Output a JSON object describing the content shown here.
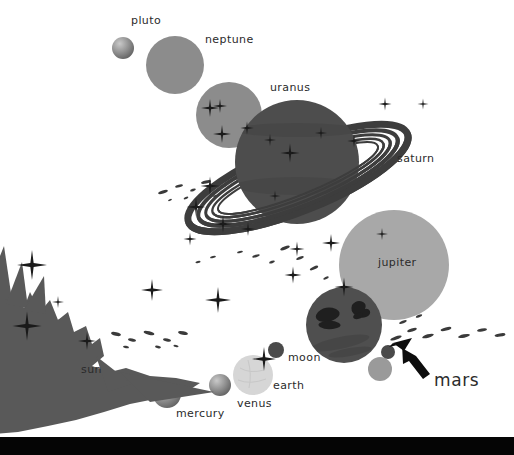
{
  "canvas": {
    "width": 514,
    "height": 455,
    "background": "#ffffff",
    "description": "Stylized solar system poster illustration, grayscale, planets labelled in lowercase, black band across the bottom edge"
  },
  "palette": {
    "background": "#ffffff",
    "ink": "#2b2b2b",
    "bottom_bar": "#050505",
    "planet_dark": "#4d4d4d",
    "planet_mid": "#8c8c8c",
    "planet_light": "#b3b3b3",
    "planet_pale": "#d4d4d4",
    "sun_body": "#595959",
    "mars_body": "#4f4f4f",
    "ring": "#3d3d3d",
    "star": "#1a1a1a",
    "debris": "#3a3a3a",
    "arrow": "#0d0d0d"
  },
  "labels": [
    {
      "id": "pluto",
      "text": "pluto",
      "x": 131,
      "y": 21,
      "size": "small"
    },
    {
      "id": "neptune",
      "text": "neptune",
      "x": 205,
      "y": 40,
      "size": "small"
    },
    {
      "id": "uranus",
      "text": "uranus",
      "x": 270,
      "y": 88,
      "size": "small"
    },
    {
      "id": "saturn",
      "text": "saturn",
      "x": 397,
      "y": 159,
      "size": "small"
    },
    {
      "id": "jupiter",
      "text": "jupiter",
      "x": 378,
      "y": 263,
      "size": "small"
    },
    {
      "id": "moon",
      "text": "moon",
      "x": 288,
      "y": 358,
      "size": "small"
    },
    {
      "id": "earth",
      "text": "earth",
      "x": 273,
      "y": 386,
      "size": "small"
    },
    {
      "id": "venus",
      "text": "venus",
      "x": 237,
      "y": 404,
      "size": "small"
    },
    {
      "id": "mercury",
      "text": "mercury",
      "x": 176,
      "y": 414,
      "size": "small"
    },
    {
      "id": "sun",
      "text": "sun",
      "x": 81,
      "y": 370,
      "size": "small"
    },
    {
      "id": "mars",
      "text": "mars",
      "x": 434,
      "y": 381,
      "size": "big"
    }
  ],
  "bodies": [
    {
      "id": "pluto",
      "name": "pluto",
      "cx": 123,
      "cy": 48,
      "r": 11,
      "fill": "#8f8f8f",
      "shaded": true
    },
    {
      "id": "neptune",
      "name": "neptune",
      "cx": 175,
      "cy": 65,
      "r": 29,
      "fill": "#8c8c8c",
      "shaded": false
    },
    {
      "id": "uranus",
      "name": "uranus",
      "cx": 229,
      "cy": 115,
      "r": 33,
      "fill": "#8c8c8c",
      "shaded": false
    },
    {
      "id": "saturn",
      "name": "saturn",
      "cx": 297,
      "cy": 162,
      "r": 62,
      "fill": "#4d4d4d",
      "shaded": false
    },
    {
      "id": "jupiter",
      "name": "jupiter",
      "cx": 394,
      "cy": 265,
      "r": 55,
      "fill": "#a8a8a8",
      "shaded": false
    },
    {
      "id": "mars",
      "name": "mars",
      "cx": 344,
      "cy": 325,
      "r": 38,
      "fill": "#4f4f4f",
      "shaded": false
    },
    {
      "id": "moon",
      "name": "moon",
      "cx": 276,
      "cy": 350,
      "r": 8,
      "fill": "#4a4a4a",
      "shaded": false
    },
    {
      "id": "earth",
      "name": "earth",
      "cx": 253,
      "cy": 375,
      "r": 20,
      "fill": "#d6d6d6",
      "shaded": false
    },
    {
      "id": "venus",
      "name": "venus",
      "cx": 220,
      "cy": 385,
      "r": 11,
      "fill": "#8a8a8a",
      "shaded": true
    },
    {
      "id": "mercury",
      "name": "mercury",
      "cx": 167,
      "cy": 394,
      "r": 14,
      "fill": "#8f8f8f",
      "shaded": true
    },
    {
      "id": "asteroid-a",
      "name": "asteroid",
      "cx": 380,
      "cy": 369,
      "r": 12,
      "fill": "#9a9a9a",
      "shaded": false
    },
    {
      "id": "asteroid-b",
      "name": "asteroid",
      "cx": 388,
      "cy": 352,
      "r": 7,
      "fill": "#4a4a4a",
      "shaded": false
    }
  ],
  "saturn_ring": {
    "cx": 298,
    "cy": 178,
    "rx": 118,
    "ry": 34,
    "rotation_deg": -22,
    "bands": 6,
    "color": "#3d3d3d"
  },
  "sun": {
    "id": "sun",
    "description": "spiky flame-like corona silhouette anchored at the lower-left corner",
    "color": "#595959"
  },
  "arrow": {
    "id": "mars-pointer",
    "description": "thick black arrow pointing up-left at mars",
    "tip_x": 395,
    "tip_y": 344,
    "tail_x": 432,
    "tail_y": 375,
    "color": "#0d0d0d"
  },
  "stars": [
    {
      "x": 32,
      "y": 265,
      "size": 30
    },
    {
      "x": 27,
      "y": 326,
      "size": 28
    },
    {
      "x": 87,
      "y": 341,
      "size": 17
    },
    {
      "x": 152,
      "y": 290,
      "size": 22
    },
    {
      "x": 218,
      "y": 300,
      "size": 26
    },
    {
      "x": 264,
      "y": 359,
      "size": 23
    },
    {
      "x": 293,
      "y": 275,
      "size": 16
    },
    {
      "x": 297,
      "y": 249,
      "size": 14
    },
    {
      "x": 331,
      "y": 243,
      "size": 17
    },
    {
      "x": 344,
      "y": 287,
      "size": 18
    },
    {
      "x": 385,
      "y": 104,
      "size": 13
    },
    {
      "x": 354,
      "y": 141,
      "size": 13
    },
    {
      "x": 382,
      "y": 234,
      "size": 12
    },
    {
      "x": 423,
      "y": 104,
      "size": 11
    },
    {
      "x": 290,
      "y": 153,
      "size": 18
    },
    {
      "x": 270,
      "y": 140,
      "size": 12
    },
    {
      "x": 321,
      "y": 133,
      "size": 12
    },
    {
      "x": 210,
      "y": 108,
      "size": 17
    },
    {
      "x": 219,
      "y": 106,
      "size": 14
    },
    {
      "x": 222,
      "y": 134,
      "size": 17
    },
    {
      "x": 247,
      "y": 128,
      "size": 13
    },
    {
      "x": 210,
      "y": 186,
      "size": 18
    },
    {
      "x": 196,
      "y": 207,
      "size": 18
    },
    {
      "x": 223,
      "y": 224,
      "size": 16
    },
    {
      "x": 248,
      "y": 229,
      "size": 14
    },
    {
      "x": 190,
      "y": 239,
      "size": 13
    },
    {
      "x": 58,
      "y": 302,
      "size": 12
    }
  ],
  "debris_belts": [
    {
      "id": "belt-upper",
      "points": "160,193 172,186 186,188 200,180 214,184 228,176 243,181 256,174 268,178"
    },
    {
      "id": "belt-mid",
      "points": "118,333 134,338 150,330 168,336 184,329 200,335 216,328 232,334"
    },
    {
      "id": "belt-lower",
      "points": "392,339 410,332 428,337 446,330 464,336 482,329 500,334"
    }
  ]
}
